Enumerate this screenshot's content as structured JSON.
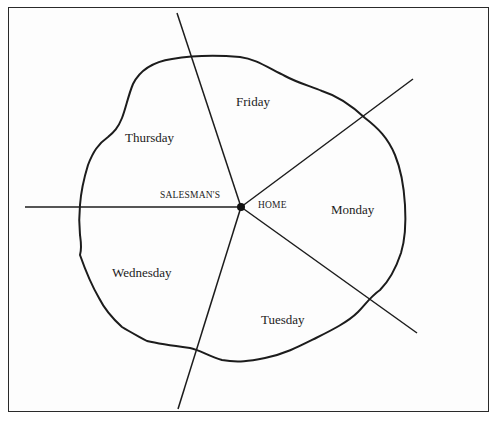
{
  "diagram": {
    "title": "",
    "center_label_left": "SALESMAN'S",
    "center_label_right": "HOME",
    "regions": [
      {
        "day": "Monday"
      },
      {
        "day": "Tuesday"
      },
      {
        "day": "Wednesday"
      },
      {
        "day": "Thursday"
      },
      {
        "day": "Friday"
      }
    ],
    "colors": {
      "line": "#1c1c1c",
      "background": "#ffffff",
      "border": "#2a2a2a"
    },
    "center_point": {
      "x": 241,
      "y": 207
    },
    "rays": [
      {
        "name": "left",
        "x": 25,
        "y": 207
      },
      {
        "name": "top",
        "x": 177,
        "y": 13
      },
      {
        "name": "upper-right",
        "x": 413,
        "y": 79
      },
      {
        "name": "lower-right",
        "x": 417,
        "y": 333
      },
      {
        "name": "bottom",
        "x": 178,
        "y": 409
      }
    ]
  }
}
